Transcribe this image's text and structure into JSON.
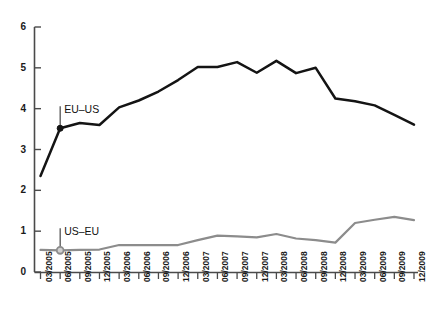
{
  "chart_data": {
    "type": "line",
    "title": "",
    "xlabel": "",
    "ylabel": "",
    "ylim": [
      0,
      6
    ],
    "yticks": [
      0,
      1,
      2,
      3,
      4,
      5,
      6
    ],
    "grid": false,
    "legend_position": "inline-annotation",
    "categories": [
      "03/2005",
      "06/2005",
      "09/2005",
      "12/2005",
      "03/2006",
      "06/2006",
      "09/2006",
      "12/2006",
      "03/2007",
      "06/2007",
      "09/2007",
      "12/2007",
      "03/2008",
      "06/2008",
      "09/2008",
      "12/2008",
      "03/2009",
      "06/2009",
      "09/2009",
      "12/2009"
    ],
    "series": [
      {
        "name": "EU–US",
        "color": "#141414",
        "marker_index": 1,
        "marker_style": "filled-circle",
        "values": [
          2.35,
          3.52,
          3.65,
          3.6,
          4.03,
          4.2,
          4.42,
          4.7,
          5.02,
          5.02,
          5.14,
          4.88,
          5.17,
          4.87,
          5.0,
          4.25,
          4.18,
          4.08,
          3.85,
          3.61
        ]
      },
      {
        "name": "US–EU",
        "color": "#8c8c8c",
        "marker_index": 1,
        "marker_style": "open-circle",
        "values": [
          0.54,
          0.53,
          0.54,
          0.55,
          0.66,
          0.66,
          0.66,
          0.66,
          0.78,
          0.89,
          0.87,
          0.85,
          0.93,
          0.82,
          0.78,
          0.72,
          1.2,
          1.28,
          1.35,
          1.27
        ]
      }
    ],
    "annotations": [
      {
        "text": "EU–US",
        "series": "EU–US",
        "at_category": "06/2005"
      },
      {
        "text": "US–EU",
        "series": "US–EU",
        "at_category": "06/2005"
      }
    ]
  }
}
